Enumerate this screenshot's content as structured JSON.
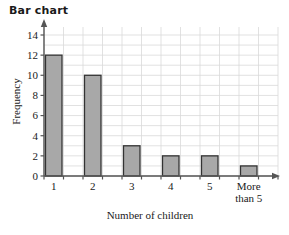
{
  "chart_data": {
    "type": "bar",
    "title": "Bar chart",
    "xlabel": "Number of children",
    "ylabel": "Frequency",
    "categories": [
      "1",
      "2",
      "3",
      "4",
      "5",
      "More than 5"
    ],
    "category_lines": [
      [
        "1"
      ],
      [
        "2"
      ],
      [
        "3"
      ],
      [
        "4"
      ],
      [
        "5"
      ],
      [
        "More",
        "than 5"
      ]
    ],
    "values": [
      12,
      10,
      3,
      2,
      2,
      1
    ],
    "ylim": [
      0,
      15
    ],
    "ytick_values": [
      0,
      2,
      4,
      6,
      8,
      10,
      12,
      14
    ],
    "ytick_labels": [
      "0",
      "2",
      "4",
      "6",
      "8",
      "10",
      "12",
      "14"
    ],
    "grid": true,
    "grid_color": "#d9d9d9",
    "bar_fill": "#a8a8a8",
    "bar_stroke": "#333333",
    "axis_color": "#555555",
    "legend": null
  }
}
